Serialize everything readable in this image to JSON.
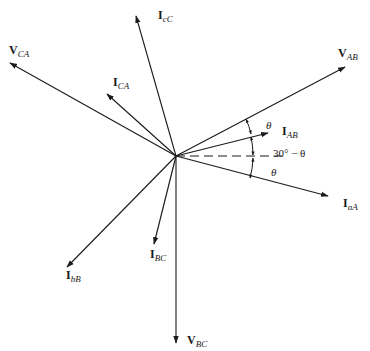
{
  "diagram": {
    "origin": {
      "x": 176,
      "y": 156
    },
    "phasors": [
      {
        "id": "VAB",
        "main": "V",
        "sub": "AB",
        "tip": {
          "x": 345,
          "y": 67
        },
        "label_pos": {
          "x": 338,
          "y": 57
        }
      },
      {
        "id": "IAB",
        "main": "I",
        "sub": "AB",
        "tip": {
          "x": 268,
          "y": 133
        },
        "label_pos": {
          "x": 282,
          "y": 135
        }
      },
      {
        "id": "IaA",
        "main": "I",
        "sub": "aA",
        "tip": {
          "x": 328,
          "y": 196
        },
        "label_pos": {
          "x": 343,
          "y": 207
        }
      },
      {
        "id": "VCA",
        "main": "V",
        "sub": "CA",
        "tip": {
          "x": 10,
          "y": 63
        },
        "label_pos": {
          "x": 9,
          "y": 54
        }
      },
      {
        "id": "ICA",
        "main": "I",
        "sub": "CA",
        "tip": {
          "x": 107,
          "y": 94
        },
        "label_pos": {
          "x": 113,
          "y": 86
        }
      },
      {
        "id": "IcC",
        "main": "I",
        "sub": "cC",
        "tip": {
          "x": 136,
          "y": 16
        },
        "label_pos": {
          "x": 158,
          "y": 19
        }
      },
      {
        "id": "IbB",
        "main": "I",
        "sub": "bB",
        "tip": {
          "x": 67,
          "y": 267
        },
        "label_pos": {
          "x": 66,
          "y": 279
        }
      },
      {
        "id": "IBC",
        "main": "I",
        "sub": "BC",
        "tip": {
          "x": 154,
          "y": 244
        },
        "label_pos": {
          "x": 150,
          "y": 258
        }
      },
      {
        "id": "VBC",
        "main": "V",
        "sub": "BC",
        "tip": {
          "x": 176,
          "y": 343
        },
        "label_pos": {
          "x": 187,
          "y": 344
        }
      }
    ],
    "reference_line": {
      "style": "dashed",
      "end": {
        "x": 282,
        "y": 156
      }
    },
    "angles": [
      {
        "label": "θ",
        "pos": {
          "x": 266,
          "y": 129
        }
      },
      {
        "label": "30° − θ",
        "pos": {
          "x": 273,
          "y": 157
        }
      },
      {
        "label": "θ",
        "pos": {
          "x": 271,
          "y": 176
        }
      }
    ]
  }
}
